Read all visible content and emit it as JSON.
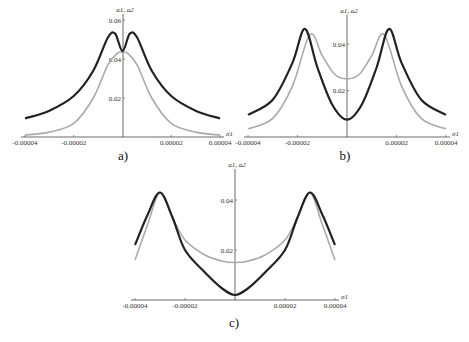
{
  "chart_data": [
    {
      "id": "a",
      "type": "line",
      "caption": "a)",
      "xlabel": "σ1",
      "ylabel": "a1, a2",
      "x_ticks": [
        "-0.00004",
        "-0.00002",
        "0.00002",
        "0.00004"
      ],
      "y_ticks": [
        "0.02",
        "0.04",
        "0.06"
      ],
      "xlim": [
        -4e-05,
        4e-05
      ],
      "ylim": [
        0,
        0.06
      ],
      "series": [
        {
          "name": "a1",
          "color": "#222222",
          "x": [
            -4e-05,
            -3e-05,
            -2e-05,
            -1.2e-05,
            -6e-06,
            -3e-06,
            0,
            3e-06,
            6e-06,
            1.2e-05,
            2e-05,
            3e-05,
            4e-05
          ],
          "y": [
            0.0095,
            0.0135,
            0.021,
            0.034,
            0.051,
            0.053,
            0.044,
            0.053,
            0.051,
            0.034,
            0.021,
            0.0135,
            0.0095
          ]
        },
        {
          "name": "a2",
          "color": "#aaaaaa",
          "x": [
            -4e-05,
            -3e-05,
            -2e-05,
            -1.2e-05,
            -6e-06,
            -2e-06,
            0,
            2e-06,
            6e-06,
            1.2e-05,
            2e-05,
            3e-05,
            4e-05
          ],
          "y": [
            0.001,
            0.0025,
            0.007,
            0.02,
            0.037,
            0.043,
            0.0435,
            0.043,
            0.037,
            0.02,
            0.007,
            0.0025,
            0.001
          ]
        }
      ]
    },
    {
      "id": "b",
      "type": "line",
      "caption": "b)",
      "xlabel": "σ1",
      "ylabel": "a1, a2",
      "x_ticks": [
        "-0.00004",
        "-0.00002",
        "0.00002",
        "0.00004"
      ],
      "y_ticks": [
        "0.02",
        "0.04"
      ],
      "xlim": [
        -4e-05,
        4e-05
      ],
      "ylim": [
        0,
        0.05
      ],
      "series": [
        {
          "name": "a1",
          "color": "#222222",
          "x": [
            -4e-05,
            -3e-05,
            -2.2e-05,
            -1.7e-05,
            -1.2e-05,
            -6e-06,
            0,
            6e-06,
            1.2e-05,
            1.7e-05,
            2.2e-05,
            3e-05,
            4e-05
          ],
          "y": [
            0.0095,
            0.016,
            0.032,
            0.0465,
            0.03,
            0.014,
            0.0075,
            0.014,
            0.03,
            0.0465,
            0.032,
            0.016,
            0.0095
          ]
        },
        {
          "name": "a2",
          "color": "#aaaaaa",
          "x": [
            -4e-05,
            -3e-05,
            -2.2e-05,
            -1.5e-05,
            -1e-05,
            -5e-06,
            0,
            5e-06,
            1e-05,
            1.5e-05,
            2.2e-05,
            3e-05,
            4e-05
          ],
          "y": [
            0.0035,
            0.008,
            0.022,
            0.044,
            0.035,
            0.027,
            0.025,
            0.027,
            0.035,
            0.044,
            0.022,
            0.008,
            0.0035
          ]
        }
      ]
    },
    {
      "id": "c",
      "type": "line",
      "caption": "c)",
      "xlabel": "σ1",
      "ylabel": "a1, a2",
      "x_ticks": [
        "-0.00004",
        "-0.00002",
        "0.00002",
        "0.00004"
      ],
      "y_ticks": [
        "0.02",
        "0.04"
      ],
      "xlim": [
        -4e-05,
        4e-05
      ],
      "ylim": [
        0,
        0.05
      ],
      "series": [
        {
          "name": "a1",
          "color": "#222222",
          "x": [
            -4e-05,
            -3.5e-05,
            -3e-05,
            -2.5e-05,
            -2e-05,
            -1.2e-05,
            -5e-06,
            0,
            5e-06,
            1.2e-05,
            2e-05,
            2.5e-05,
            3e-05,
            3.5e-05,
            4e-05
          ],
          "y": [
            0.022,
            0.034,
            0.043,
            0.033,
            0.02,
            0.011,
            0.0045,
            0.002,
            0.0045,
            0.011,
            0.02,
            0.033,
            0.043,
            0.034,
            0.022
          ]
        },
        {
          "name": "a2",
          "color": "#aaaaaa",
          "x": [
            -4e-05,
            -3.5e-05,
            -3e-05,
            -2.5e-05,
            -2e-05,
            -1.2e-05,
            -5e-06,
            0,
            5e-06,
            1.2e-05,
            2e-05,
            2.5e-05,
            3e-05,
            3.5e-05,
            4e-05
          ],
          "y": [
            0.016,
            0.03,
            0.043,
            0.033,
            0.024,
            0.018,
            0.0155,
            0.015,
            0.0155,
            0.018,
            0.024,
            0.033,
            0.043,
            0.03,
            0.016
          ]
        }
      ]
    }
  ]
}
